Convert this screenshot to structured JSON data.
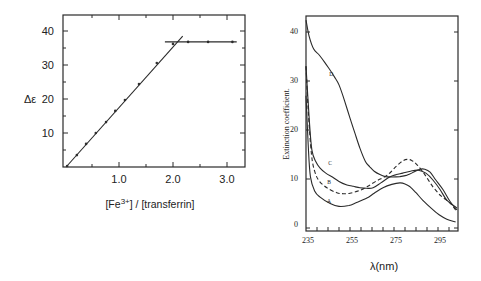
{
  "chart_data": [
    {
      "type": "line",
      "title": "",
      "xlabel": "[Fe3+] / [transferrin]",
      "xlabel_parts": {
        "pre": "[Fe",
        "sup": "3+",
        "post": "] / [transferrin]"
      },
      "ylabel": "Δε",
      "xlim": [
        0,
        3.3
      ],
      "ylim": [
        0,
        44
      ],
      "xticks": [
        1.0,
        2.0,
        3.0
      ],
      "xtick_labels": [
        "1.0",
        "2.0",
        "3.0"
      ],
      "xminor_step": 0.5,
      "yticks": [
        10,
        20,
        30,
        40
      ],
      "ytick_labels": [
        "10",
        "20",
        "30",
        "40"
      ],
      "yminor_step": 5,
      "grid": false,
      "series": [
        {
          "name": "titration points",
          "style": "markers",
          "x": [
            0.04,
            0.22,
            0.39,
            0.57,
            0.76,
            0.93,
            1.11,
            1.37,
            1.7,
            2.0,
            2.28,
            2.65,
            3.1
          ],
          "y": [
            0.3,
            3.5,
            6.8,
            10.0,
            13.2,
            16.5,
            19.7,
            24.4,
            30.6,
            36.2,
            36.8,
            36.8,
            36.8
          ]
        },
        {
          "name": "linear fit",
          "style": "line",
          "x": [
            0.02,
            2.18
          ],
          "y": [
            0,
            38.5
          ]
        },
        {
          "name": "plateau",
          "style": "line",
          "x": [
            1.85,
            3.18
          ],
          "y": [
            36.8,
            36.8
          ]
        }
      ]
    },
    {
      "type": "line",
      "title": "",
      "xlabel": "λ(nm)",
      "ylabel": "Extinction coefficient.",
      "xlim": [
        235,
        305
      ],
      "ylim": [
        -0.6,
        43.5
      ],
      "xticks": [
        235,
        255,
        275,
        295
      ],
      "xtick_labels": [
        "235",
        "255",
        "275",
        "295"
      ],
      "xminor_step": 5,
      "yticks": [
        0,
        10,
        20,
        30,
        40
      ],
      "ytick_labels": [
        "0",
        "10",
        "20",
        "30",
        "40"
      ],
      "grid": false,
      "series": [
        {
          "name": "A",
          "style": "solid",
          "label_at": [
            245.5,
            5.6
          ],
          "x": [
            235,
            236,
            237,
            239,
            241.4,
            246,
            250,
            254.5,
            258,
            262.7,
            266,
            270,
            274,
            277.7,
            280,
            282.3,
            285,
            288,
            292,
            295.5,
            299,
            303
          ],
          "y": [
            27,
            17,
            10.5,
            7.5,
            6.3,
            5.0,
            4.4,
            4.6,
            5.2,
            6.1,
            7.1,
            8.2,
            8.9,
            9.2,
            9.0,
            8.4,
            7.2,
            5.7,
            4.0,
            2.7,
            1.8,
            1.2
          ]
        },
        {
          "name": "B",
          "style": "dashed",
          "label_at": [
            245.5,
            9.3
          ],
          "x": [
            235,
            236,
            237.5,
            239,
            241,
            244.5,
            249,
            252,
            255,
            259,
            262.7,
            267,
            272,
            276,
            279,
            281,
            283,
            285.5,
            289,
            292.7,
            296.5,
            300.5,
            303.6
          ],
          "y": [
            33,
            24,
            15,
            11.5,
            9.6,
            8.2,
            7.2,
            7.0,
            7.1,
            7.6,
            8.4,
            9.6,
            10.8,
            12.6,
            13.7,
            14.0,
            13.8,
            12.9,
            10.9,
            8.4,
            6.5,
            5.1,
            3.3
          ]
        },
        {
          "name": "C",
          "style": "solid",
          "label_at": [
            246,
            13.3
          ],
          "x": [
            235,
            236.5,
            237.7,
            239.5,
            241.4,
            244,
            247,
            250,
            253.6,
            256.5,
            259.5,
            262.5,
            265.5,
            269,
            273,
            276,
            279,
            282.5,
            286,
            289.5,
            292.7,
            296,
            299,
            303.6
          ],
          "y": [
            33,
            22,
            15.9,
            13.5,
            12.2,
            11.2,
            10.4,
            9.5,
            8.8,
            8.5,
            8.2,
            8.1,
            8.2,
            9.2,
            10.4,
            10.9,
            11.2,
            11.6,
            11.8,
            11.2,
            9.8,
            7.8,
            5.7,
            4.1
          ]
        },
        {
          "name": "D",
          "style": "solid",
          "label_at": [
            246.5,
            31.5
          ],
          "x": [
            235,
            236.5,
            238.5,
            241,
            243.5,
            246,
            248,
            250,
            252.5,
            255,
            257.5,
            259.5,
            262,
            264,
            266,
            268.6,
            271,
            274,
            277.7,
            281,
            284,
            286.8,
            289,
            291.4,
            294,
            297.3,
            300.5,
            303.6
          ],
          "y": [
            42.4,
            39,
            36.5,
            35.3,
            33.8,
            32.2,
            30.8,
            29.2,
            26,
            22.4,
            19,
            16.3,
            13.6,
            12.5,
            11.6,
            10.9,
            10.5,
            10.4,
            10.5,
            10.8,
            11.4,
            12.0,
            12.0,
            11.4,
            9.8,
            7.8,
            5.4,
            3.7
          ]
        }
      ]
    }
  ]
}
